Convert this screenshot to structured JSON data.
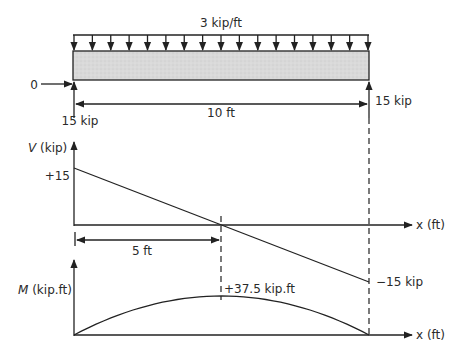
{
  "beam": {
    "load_label": "3 kip/ft",
    "left_horizontal_reaction": "0",
    "left_vertical_reaction": "15 kip",
    "right_vertical_reaction": "15 kip",
    "span_label": "10 ft",
    "span_ft": 10,
    "distributed_load_kip_per_ft": 3
  },
  "shear_diagram": {
    "axis_label_var": "V",
    "axis_label_unit": " (kip)",
    "x_axis_label": "x (ft)",
    "start_value_label": "+15",
    "end_value_label": "−15 kip",
    "zero_crossing_label": "5 ft",
    "values": {
      "x": [
        0,
        10
      ],
      "V": [
        15,
        -15
      ]
    }
  },
  "moment_diagram": {
    "axis_label_var": "M",
    "axis_label_unit": " (kip.ft)",
    "x_axis_label": "x (ft)",
    "peak_label": "+37.5 kip.ft",
    "values": {
      "x": [
        0,
        5,
        10
      ],
      "M": [
        0,
        37.5,
        0
      ]
    }
  },
  "colors": {
    "line": "#222222",
    "beam_fill": "#d9d9d9",
    "text": "#2a2a2a"
  }
}
